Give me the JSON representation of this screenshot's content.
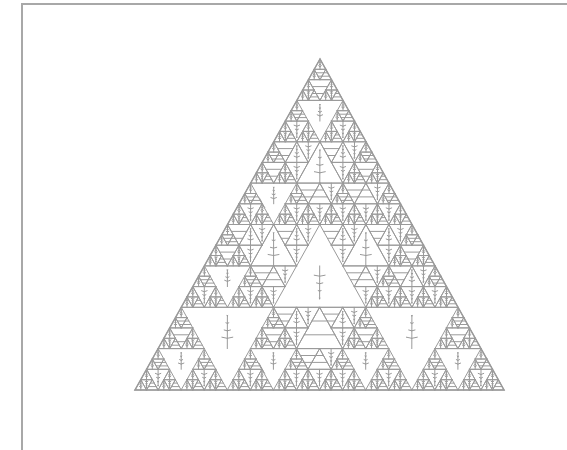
{
  "figure": {
    "title": "",
    "frame_color": "#a8a8a8",
    "stroke_color": "#9a9a9a",
    "background": "#ffffff",
    "triangle": {
      "apex": [
        320,
        59
      ],
      "base_left": [
        135,
        390
      ],
      "base_right": [
        504,
        390
      ]
    },
    "depth": 5
  }
}
